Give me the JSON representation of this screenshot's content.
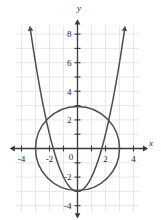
{
  "figure": {
    "name": "coordinate-plane-circle-parabola",
    "background_color": "#ffffff",
    "grid_color": "#e6e2e6",
    "axis_color": "#3a3a3a",
    "curve_color": "#4d4d4d"
  },
  "axes": {
    "x_axis_label": "x",
    "y_axis_label": "y",
    "x_ticks": [
      {
        "value": -4,
        "label": "-4"
      },
      {
        "value": -3,
        "label": ""
      },
      {
        "value": -2,
        "label": "-2"
      },
      {
        "value": -1,
        "label": ""
      },
      {
        "value": 1,
        "label": ""
      },
      {
        "value": 2,
        "label": "2"
      },
      {
        "value": 3,
        "label": ""
      },
      {
        "value": 4,
        "label": "4"
      }
    ],
    "y_ticks": [
      {
        "value": 8,
        "label": "8"
      },
      {
        "value": 7,
        "label": ""
      },
      {
        "value": 6,
        "label": "6"
      },
      {
        "value": 5,
        "label": ""
      },
      {
        "value": 4,
        "label": "4"
      },
      {
        "value": 3,
        "label": ""
      },
      {
        "value": 2,
        "label": "2"
      },
      {
        "value": 1,
        "label": ""
      },
      {
        "value": -1,
        "label": ""
      },
      {
        "value": -2,
        "label": "-2"
      },
      {
        "value": -3,
        "label": ""
      },
      {
        "value": -4,
        "label": "-4"
      }
    ],
    "origin_label": "0",
    "x_range": [
      -4.6,
      4.8
    ],
    "y_range": [
      -4.6,
      8.8
    ]
  },
  "chart_data": {
    "type": "line",
    "title": "",
    "xlabel": "x",
    "ylabel": "y",
    "xlim": [
      -4.6,
      4.8
    ],
    "ylim": [
      -4.6,
      8.8
    ],
    "grid": true,
    "legend": "none",
    "series": [
      {
        "name": "circle",
        "equation": "x^2 + y^2 = 9",
        "shape": "circle",
        "center": [
          0,
          0
        ],
        "radius": 3,
        "closed": true,
        "arrows": "none"
      },
      {
        "name": "parabola",
        "equation": "y = x^2 - 3",
        "shape": "parabola",
        "vertex": [
          0,
          -3
        ],
        "a": 1,
        "arrows": "both-ends-up",
        "x_domain": [
          -3.35,
          3.35
        ],
        "points": [
          {
            "x": -3.35,
            "y": 8.2
          },
          {
            "x": -3.0,
            "y": 6.0
          },
          {
            "x": -2.5,
            "y": 3.25
          },
          {
            "x": -2.0,
            "y": 1.0
          },
          {
            "x": -1.5,
            "y": -0.75
          },
          {
            "x": -1.0,
            "y": -2.0
          },
          {
            "x": -0.5,
            "y": -2.75
          },
          {
            "x": 0,
            "y": -3.0
          },
          {
            "x": 0.5,
            "y": -2.75
          },
          {
            "x": 1.0,
            "y": -2.0
          },
          {
            "x": 1.5,
            "y": -0.75
          },
          {
            "x": 2.0,
            "y": 1.0
          },
          {
            "x": 2.5,
            "y": 3.25
          },
          {
            "x": 3.0,
            "y": 6.0
          },
          {
            "x": 3.35,
            "y": 8.2
          }
        ]
      }
    ],
    "intersections": [
      {
        "x": -1.73,
        "y": -0.0,
        "note": "approximate curve crossings"
      },
      {
        "x": 1.73,
        "y": -0.0,
        "note": "approximate curve crossings"
      }
    ]
  }
}
